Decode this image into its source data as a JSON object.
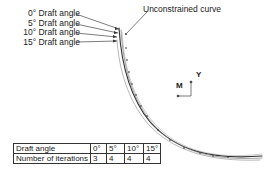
{
  "diagram": {
    "angle_labels": [
      "0° Draft angle",
      "5° Draft angle",
      "10° Draft angle",
      "15° Draft angle"
    ],
    "unconstrained_label": "Unconstrained curve",
    "axes": {
      "horizontal": "M",
      "vertical": "Y"
    }
  },
  "table": {
    "header": [
      "Draft angle",
      "0°",
      "5°",
      "10°",
      "15°"
    ],
    "row": [
      "Number of iterations",
      "3",
      "4",
      "4",
      "4"
    ]
  },
  "colors": {
    "curve": "#333333",
    "text": "#1a1a1a"
  }
}
